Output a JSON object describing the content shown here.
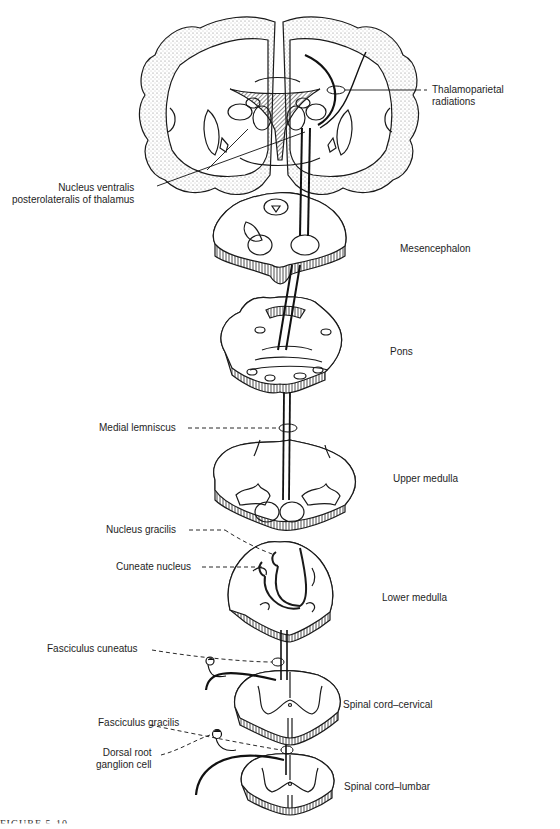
{
  "figure": {
    "caption_fragment": "FIGURE 5-10",
    "colors": {
      "ink": "#1a1a1a",
      "stipple": "#555555",
      "background": "#ffffff"
    }
  },
  "labels": {
    "thalamoparietal": [
      "Thalamoparietal",
      "radiations"
    ],
    "nucleus_vpl": [
      "Nucleus ventralis",
      "posterolateralis of thalamus"
    ],
    "mesencephalon": "Mesencephalon",
    "pons": "Pons",
    "medial_lemniscus": "Medial lemniscus",
    "upper_medulla": "Upper medulla",
    "nucleus_gracilis": "Nucleus gracilis",
    "cuneate_nucleus": "Cuneate nucleus",
    "lower_medulla": "Lower medulla",
    "fasciculus_cuneatus": "Fasciculus cuneatus",
    "spinal_cord_cervical": "Spinal cord–cervical",
    "fasciculus_gracilis": "Fasciculus gracilis",
    "dorsal_root_ganglion": [
      "Dorsal root",
      "ganglion cell"
    ],
    "spinal_cord_lumbar": "Spinal cord–lumbar"
  },
  "sections": [
    "Cerebrum (coronal)",
    "Mesencephalon",
    "Pons",
    "Upper medulla",
    "Lower medulla",
    "Spinal cord–cervical",
    "Spinal cord–lumbar"
  ]
}
